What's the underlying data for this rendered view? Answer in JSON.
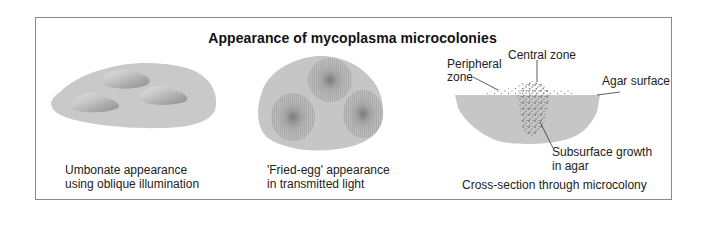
{
  "diagram": {
    "title": "Appearance of mycoplasma microcolonies",
    "panels": [
      {
        "id": "umbonate",
        "caption_line1": "Umbonate appearance",
        "caption_line2": "using oblique illumination"
      },
      {
        "id": "fried-egg",
        "caption_line1": "'Fried-egg' appearance",
        "caption_line2": "in transmitted light"
      },
      {
        "id": "cross-section",
        "caption": "Cross-section through microcolony",
        "labels": {
          "central_zone": "Central zone",
          "peripheral_zone_line1": "Peripheral",
          "peripheral_zone_line2": "zone",
          "agar_surface": "Agar surface",
          "subsurface_line1": "Subsurface growth",
          "subsurface_line2": "in agar"
        }
      }
    ],
    "colors": {
      "agar": "#c8c8c8",
      "frame": "#8a8a8a",
      "text": "#222222"
    }
  }
}
